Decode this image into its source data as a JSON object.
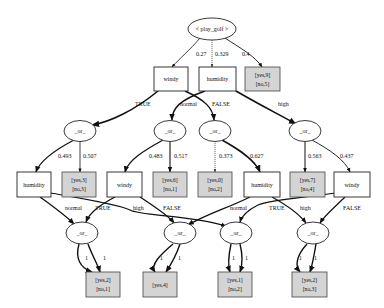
{
  "diagram": {
    "root": {
      "label": "< play_golf >"
    },
    "top_edges": [
      {
        "label": "0.27",
        "target": "windy"
      },
      {
        "label": "0.329",
        "target": "humidity"
      },
      {
        "label": "0.4",
        "target": "leaf_root"
      }
    ],
    "level1": {
      "windy": {
        "label": "windy"
      },
      "humidity": {
        "label": "humidity"
      },
      "leaf_root": {
        "line1": "[yes,9]",
        "line2": "[no,5]"
      }
    },
    "level1_edges": [
      {
        "from": "windy",
        "label": "TRUE",
        "to": "or1"
      },
      {
        "from": "humidity",
        "label": "normal",
        "to": "or2"
      },
      {
        "from": "windy",
        "label": "FALSE",
        "to": "or3"
      },
      {
        "from": "humidity",
        "label": "high",
        "to": "or4"
      }
    ],
    "or_label": "_or_",
    "level2_or": [
      {
        "id": "or1",
        "left_weight": "0.493",
        "right_weight": "0.507"
      },
      {
        "id": "or2",
        "left_weight": "0.483",
        "right_weight": "0.517"
      },
      {
        "id": "or3",
        "left_weight": "0.373",
        "right_weight": "0.627"
      },
      {
        "id": "or4",
        "left_weight": "0.563",
        "right_weight": "0.437"
      }
    ],
    "level3": [
      {
        "type": "attr",
        "label": "humidity"
      },
      {
        "type": "leaf",
        "line1": "[yes,3]",
        "line2": "[no,3]"
      },
      {
        "type": "attr",
        "label": "windy"
      },
      {
        "type": "leaf",
        "line1": "[yes,6]",
        "line2": "[no,1]"
      },
      {
        "type": "leaf",
        "line1": "[yes,0]",
        "line2": "[no,2]"
      },
      {
        "type": "attr",
        "label": "humidity"
      },
      {
        "type": "leaf",
        "line1": "[yes,7]",
        "line2": "[no,4]"
      },
      {
        "type": "attr",
        "label": "windy"
      }
    ],
    "level3_edges": [
      {
        "from": "humidity-left",
        "label": "normal",
        "to": "bor1"
      },
      {
        "from": "windy-left",
        "label": "TRUE",
        "to": "bor1"
      },
      {
        "from": "humidity-left",
        "label": "high",
        "to": "bor3"
      },
      {
        "from": "windy-left",
        "label": "FALSE",
        "to": "bor2"
      },
      {
        "from": "humidity-right",
        "label": "normal",
        "to": "bor2"
      },
      {
        "from": "windy-right",
        "label": "TRUE",
        "to": "bor3"
      },
      {
        "from": "humidity-right",
        "label": "high",
        "to": "bor4"
      },
      {
        "from": "windy-right",
        "label": "FALSE",
        "to": "bor4"
      }
    ],
    "bottom_edge_weight": "1",
    "bottom_leaves": [
      {
        "line1": "[yes,2]",
        "line2": "[no,1]"
      },
      {
        "line1": "[yes,4]",
        "line2": ""
      },
      {
        "line1": "[yes,1]",
        "line2": "[no,2]"
      },
      {
        "line1": "[yes,2]",
        "line2": "[no,3]"
      }
    ]
  }
}
